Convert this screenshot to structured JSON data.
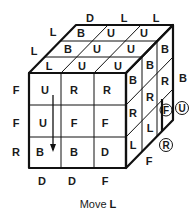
{
  "diagram": {
    "type": "rubiks-cube-move",
    "caption": "Move L",
    "caption_prefix": "Move",
    "caption_move": "L",
    "top_face": [
      [
        "B",
        "U",
        "U"
      ],
      [
        "B",
        "U",
        "U"
      ],
      [
        "L",
        "U",
        "U"
      ]
    ],
    "front_face": [
      [
        "U",
        "R",
        "R"
      ],
      [
        "U",
        "F",
        "F"
      ],
      [
        "B",
        "B",
        "D"
      ]
    ],
    "right_face": [
      [
        "B",
        "B",
        "B"
      ],
      [
        "R",
        "R",
        "R"
      ],
      [
        "L",
        "L",
        "F"
      ]
    ],
    "left_side_labels": [
      "F",
      "F",
      "R"
    ],
    "left_top_labels": [
      "L",
      "L"
    ],
    "back_top_labels": [
      "D",
      "L",
      "L"
    ],
    "bottom_labels": [
      "D",
      "D",
      "F"
    ],
    "right_outer_labels": [
      "B"
    ],
    "bottom_right_label": "F",
    "circled_labels": [
      "F",
      "U",
      "R"
    ],
    "arrow": "down-on-left-column"
  }
}
